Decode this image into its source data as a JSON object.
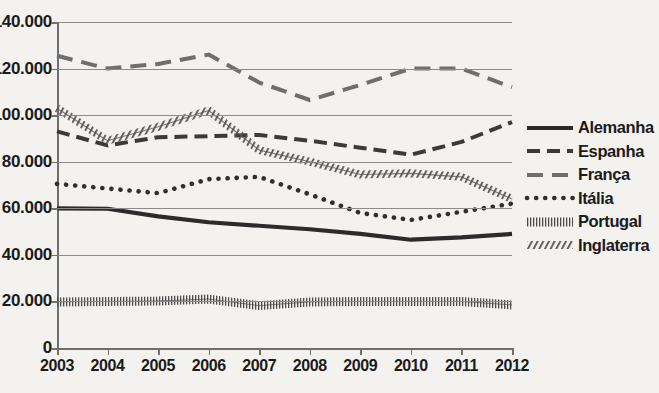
{
  "chart_data": {
    "type": "line",
    "title": "",
    "xlabel": "",
    "ylabel": "",
    "x": [
      2003,
      2004,
      2005,
      2006,
      2007,
      2008,
      2009,
      2010,
      2011,
      2012
    ],
    "categories": [
      "2003",
      "2004",
      "2005",
      "2006",
      "2007",
      "2008",
      "2009",
      "2010",
      "2011",
      "2012"
    ],
    "ylim": [
      0,
      140000
    ],
    "ytick_values": [
      0,
      20000,
      40000,
      60000,
      80000,
      100000,
      120000,
      140000
    ],
    "ytick_labels": [
      "0",
      "20.000",
      "40.000",
      "60.000",
      "80.000",
      "100.000",
      "120.000",
      "140.000"
    ],
    "grid": "horizontal",
    "legend_position": "right",
    "series": [
      {
        "name": "Alemanha",
        "style": "solid",
        "color": "#2b2b2b",
        "values": [
          60000,
          59800,
          56500,
          54000,
          52500,
          51000,
          49000,
          46500,
          47500,
          49000
        ]
      },
      {
        "name": "Espanha",
        "style": "dashed",
        "color": "#3a3a3a",
        "values": [
          93000,
          87000,
          90500,
          91000,
          91500,
          89000,
          86000,
          83000,
          88500,
          97000
        ]
      },
      {
        "name": "França",
        "style": "long-dash",
        "color": "#6e6e6e",
        "values": [
          125500,
          120000,
          122000,
          126000,
          114000,
          106500,
          113000,
          120000,
          120000,
          112000
        ]
      },
      {
        "name": "Itália",
        "style": "dotted",
        "color": "#2f2f2f",
        "values": [
          70500,
          68500,
          66500,
          72500,
          73500,
          66000,
          58000,
          55000,
          58500,
          62000
        ]
      },
      {
        "name": "Portugal",
        "style": "fine-hatch",
        "color": "#4a4a4a",
        "values": [
          19800,
          20000,
          20200,
          21000,
          18200,
          19800,
          20000,
          20000,
          20000,
          18500
        ]
      },
      {
        "name": "Inglaterra",
        "style": "diagonal-hatch",
        "color": "#565656",
        "values": [
          103000,
          89000,
          95000,
          102000,
          85000,
          80000,
          74500,
          75000,
          73500,
          64000
        ]
      }
    ]
  },
  "legend": {
    "items": [
      {
        "label": "Alemanha"
      },
      {
        "label": "Espanha"
      },
      {
        "label": "França"
      },
      {
        "label": "Itália"
      },
      {
        "label": "Portugal"
      },
      {
        "label": "Inglaterra"
      }
    ]
  }
}
